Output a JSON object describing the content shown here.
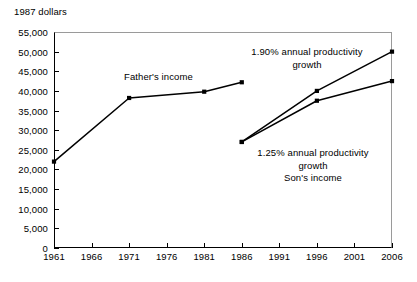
{
  "chart_data": {
    "type": "line",
    "title": "",
    "unit_label": "1987 dollars",
    "xlabel": "",
    "ylabel": "",
    "xlim": [
      1961,
      2006
    ],
    "ylim": [
      0,
      55000
    ],
    "grid": false,
    "legend_position": "inline-annotations",
    "x_ticks": [
      "1961",
      "1966",
      "1971",
      "1976",
      "1981",
      "1986",
      "1991",
      "1996",
      "2001",
      "2006"
    ],
    "x_tick_values": [
      1961,
      1966,
      1971,
      1976,
      1981,
      1986,
      1991,
      1996,
      2001,
      2006
    ],
    "y_ticks": [
      "0",
      "5,000",
      "10,000",
      "15,000",
      "20,000",
      "25,000",
      "30,000",
      "35,000",
      "40,000",
      "45,000",
      "50,000",
      "55,000"
    ],
    "y_tick_values": [
      0,
      5000,
      10000,
      15000,
      20000,
      25000,
      30000,
      35000,
      40000,
      45000,
      50000,
      55000
    ],
    "series": [
      {
        "name": "Father's income",
        "x": [
          1961,
          1971,
          1981,
          1986
        ],
        "values": [
          22000,
          38200,
          39800,
          42200
        ],
        "marker": "square",
        "color": "#000000"
      },
      {
        "name": "1.90% annual productivity growth",
        "x": [
          1986,
          1996,
          2006
        ],
        "values": [
          27000,
          40000,
          50000
        ],
        "marker": "square",
        "color": "#000000"
      },
      {
        "name": "1.25% annual productivity growth",
        "x": [
          1986,
          1996,
          2006
        ],
        "values": [
          27000,
          37500,
          42500
        ],
        "marker": "square",
        "color": "#000000"
      }
    ],
    "annotations": [
      {
        "id": "father",
        "text": "Father's income"
      },
      {
        "id": "high_growth",
        "text": "1.90% annual productivity\ngrowth"
      },
      {
        "id": "low_growth",
        "text": "1.25% annual productivity\ngrowth\nSon's income"
      }
    ]
  },
  "annotation_text": {
    "father": "Father's income",
    "high_growth": "1.90% annual productivity\ngrowth",
    "low_growth": "1.25% annual productivity\ngrowth\nSon's income"
  }
}
